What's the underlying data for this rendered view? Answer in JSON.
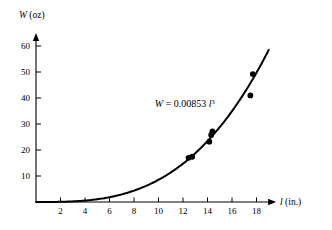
{
  "chart_data": {
    "type": "scatter",
    "title": "",
    "subtitle": "",
    "xlabel_var": "l",
    "xlabel_unit": "(in.)",
    "ylabel_var": "W",
    "ylabel_unit": "(oz)",
    "xlim": [
      0,
      19.6
    ],
    "ylim": [
      0,
      65
    ],
    "grid": false,
    "legend": "none",
    "xticks": [
      2,
      4,
      6,
      8,
      10,
      12,
      14,
      16,
      18
    ],
    "xtick_labels": [
      "2",
      "4",
      "6",
      "8",
      "10",
      "12",
      "14",
      "16",
      "18"
    ],
    "yticks": [
      10,
      20,
      30,
      40,
      50,
      60
    ],
    "ytick_labels": [
      "10",
      "20",
      "30",
      "40",
      "50",
      "60"
    ],
    "annotations": [
      {
        "name": "fit-equation",
        "lhs": "W",
        "equals": "=",
        "coefficient": "0.00853",
        "variable": "l",
        "exponent": "3",
        "full_text": "W = 0.00853 l³",
        "x": 9.7,
        "y": 36.5
      }
    ],
    "series": [
      {
        "name": "measurements",
        "type": "scatter",
        "marker": "filled-circle",
        "color": "#000000",
        "points": [
          {
            "x": 12.45,
            "y": 17.0
          },
          {
            "x": 12.75,
            "y": 17.4
          },
          {
            "x": 14.15,
            "y": 23.2
          },
          {
            "x": 14.3,
            "y": 25.8
          },
          {
            "x": 14.4,
            "y": 27.2
          },
          {
            "x": 17.5,
            "y": 41.0
          },
          {
            "x": 17.7,
            "y": 49.2
          }
        ]
      },
      {
        "name": "cubic-fit-curve",
        "type": "line",
        "color": "#000000",
        "equation": "W = 0.00853 * l^3",
        "coefficient": 0.00853,
        "exponent": 3,
        "x_start": 0,
        "x_end": 19.0
      }
    ],
    "axis_style": {
      "arrow_heads": true,
      "color": "#000000"
    }
  }
}
